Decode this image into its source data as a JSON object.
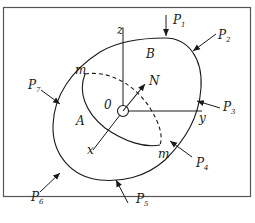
{
  "diagram": {
    "type": "contact-body-free-body-diagram",
    "axes": {
      "x": "x",
      "y": "y",
      "z": "z"
    },
    "origin_label": "0",
    "normal_label": "N",
    "regions": {
      "A": "A",
      "B": "B"
    },
    "section_points": [
      "m",
      "m"
    ],
    "forces": [
      {
        "name": "P",
        "sub": "1"
      },
      {
        "name": "P",
        "sub": "2"
      },
      {
        "name": "P",
        "sub": "3"
      },
      {
        "name": "P",
        "sub": "4"
      },
      {
        "name": "P",
        "sub": "5"
      },
      {
        "name": "P",
        "sub": "6"
      },
      {
        "name": "P",
        "sub": "7"
      }
    ],
    "colors": {
      "line": "#1a1a1a",
      "frame": "#555555",
      "background": "#ffffff"
    }
  }
}
